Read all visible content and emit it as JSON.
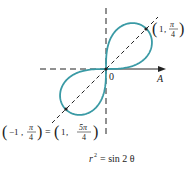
{
  "figure": {
    "type": "polar-lemniscate",
    "equation": "r² = sin 2θ",
    "equation_parts": {
      "lhs_base": "r",
      "lhs_exp": "2",
      "rhs": "= sin 2 θ"
    },
    "origin_label": "0",
    "polar_axis_label": "A",
    "point_upper": {
      "coords": "(1, π/4)",
      "r": "1",
      "theta_num": "π",
      "theta_den": "4"
    },
    "point_lower": {
      "coords_left": "(−1, π/4)",
      "coords_right": "(1, 5π/4)",
      "left_r": "−1",
      "left_theta_num": "π",
      "left_theta_den": "4",
      "equals": "=",
      "right_r": "1",
      "right_theta_num": "5π",
      "right_theta_den": "4"
    },
    "colors": {
      "curve": "#3a9aa5",
      "axes": "#222222",
      "text": "#222222"
    }
  }
}
